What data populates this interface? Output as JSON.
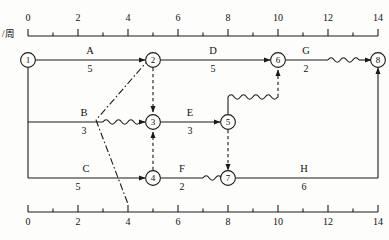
{
  "diagram": {
    "unit_label": "/周",
    "axis": {
      "min": 0,
      "max": 14,
      "ticks_major": [
        0,
        2,
        4,
        6,
        8,
        10,
        12,
        14
      ],
      "tick_labels": [
        "0",
        "2",
        "4",
        "6",
        "8",
        "10",
        "12",
        "14"
      ],
      "minor_step": 1,
      "top_axis_label": "/周",
      "bottom_axis_label": ""
    },
    "nodes": [
      {
        "id": "1",
        "label": "1",
        "time": 0,
        "row": "top"
      },
      {
        "id": "2",
        "label": "2",
        "time": 5,
        "row": "top"
      },
      {
        "id": "6",
        "label": "6",
        "time": 10,
        "row": "top"
      },
      {
        "id": "8",
        "label": "8",
        "time": 14,
        "row": "top"
      },
      {
        "id": "3",
        "label": "3",
        "time": 5,
        "row": "mid"
      },
      {
        "id": "5",
        "label": "5",
        "time": 8,
        "row": "mid"
      },
      {
        "id": "4",
        "label": "4",
        "time": 5,
        "row": "bot"
      },
      {
        "id": "7",
        "label": "7",
        "time": 8,
        "row": "bot"
      }
    ],
    "activities": [
      {
        "name": "A",
        "duration": "5",
        "from": "1",
        "to": "2",
        "start": 0,
        "end": 5,
        "row": "top",
        "float": 0
      },
      {
        "name": "D",
        "duration": "5",
        "from": "2",
        "to": "6",
        "start": 5,
        "end": 10,
        "row": "top",
        "float": 0
      },
      {
        "name": "G",
        "duration": "2",
        "from": "6",
        "to": "8",
        "start": 10,
        "end": 12,
        "row": "top",
        "float": 2
      },
      {
        "name": "B",
        "duration": "3",
        "from": "1",
        "to": "3",
        "start": 0,
        "end": 3,
        "row": "mid",
        "float": 2
      },
      {
        "name": "E",
        "duration": "3",
        "from": "3",
        "to": "5",
        "start": 5,
        "end": 8,
        "row": "mid",
        "float": 0
      },
      {
        "name": "C",
        "duration": "5",
        "from": "1",
        "to": "4",
        "start": 0,
        "end": 5,
        "row": "bot",
        "float": 0
      },
      {
        "name": "F",
        "duration": "2",
        "from": "4",
        "to": "7",
        "start": 5,
        "end": 7,
        "row": "bot",
        "float": 1
      },
      {
        "name": "H",
        "duration": "6",
        "from": "7",
        "to": "8",
        "start": 8,
        "end": 14,
        "row": "bot",
        "float": 0
      }
    ],
    "dummies": [
      {
        "from": "2",
        "to": "3",
        "style": "dashed",
        "direction": "down"
      },
      {
        "from": "4",
        "to": "3",
        "style": "dashed",
        "direction": "up"
      },
      {
        "from": "5",
        "to": "7",
        "style": "dashed",
        "direction": "down"
      },
      {
        "from": "5",
        "to": "6",
        "style": "dashed-wavy",
        "direction": "up"
      }
    ],
    "critical_path_marker": {
      "style": "dash-dot",
      "from_time": 5,
      "to_time": 4
    },
    "colors": {
      "line": "#1a1a1a",
      "text": "#111111",
      "background": "#fdfdfb"
    }
  }
}
